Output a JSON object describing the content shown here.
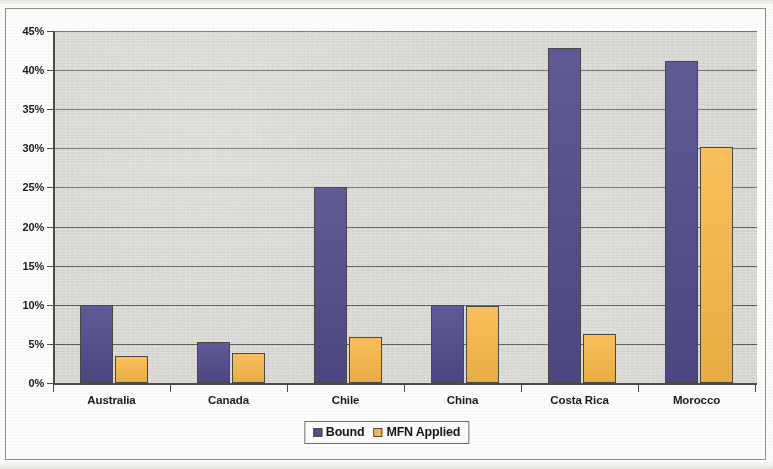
{
  "chart_data": {
    "type": "bar",
    "title": "",
    "xlabel": "",
    "ylabel": "",
    "grid": true,
    "legend_position": "bottom",
    "ylim": [
      0,
      45
    ],
    "ytick_labels": [
      "0%",
      "5%",
      "10%",
      "15%",
      "20%",
      "25%",
      "30%",
      "35%",
      "40%",
      "45%"
    ],
    "ytick_values": [
      0,
      5,
      10,
      15,
      20,
      25,
      30,
      35,
      40,
      45
    ],
    "categories": [
      "Australia",
      "Canada",
      "Chile",
      "China",
      "Costa Rica",
      "Morocco"
    ],
    "series": [
      {
        "name": "Bound",
        "color": "#544e8f",
        "values": [
          10.0,
          5.2,
          25.0,
          10.0,
          42.8,
          41.2
        ]
      },
      {
        "name": "MFN Applied",
        "color": "#fab949",
        "values": [
          3.4,
          3.8,
          5.9,
          9.9,
          6.3,
          30.2
        ]
      }
    ]
  },
  "legend": {
    "items": [
      {
        "label": "Bound",
        "swatch": "bound"
      },
      {
        "label": "MFN Applied",
        "swatch": "mfn"
      }
    ]
  },
  "colors": {
    "bound": "#544e8f",
    "mfn_applied": "#fab949",
    "plot_background": "#d8d6d2",
    "axis": "#4a4a48",
    "page_background": "#fbfbfa"
  }
}
